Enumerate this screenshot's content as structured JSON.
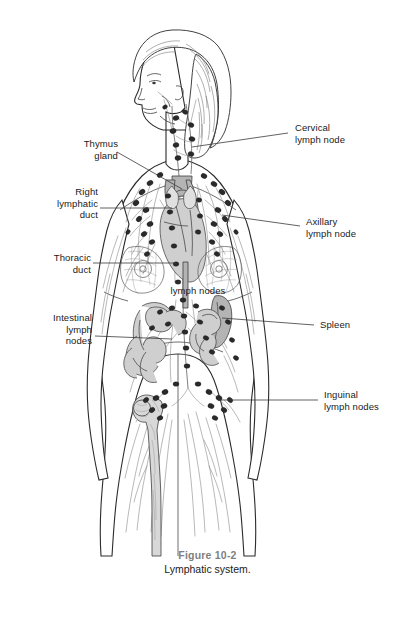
{
  "figure": {
    "number": "Figure 10-2",
    "title": "Lymphatic system."
  },
  "labels": {
    "thymus_gland": "Thymus\ngland",
    "right_lymphatic_duct": "Right\nlymphatic\nduct",
    "thoracic_duct": "Thoracic\nduct",
    "intestinal_lymph_nodes": "Intestinal\nlymph\nnodes",
    "lymph_nodes": "lymph nodes",
    "cervical_lymph_node": "Cervical\nlymph node",
    "axillary_lymph_node": "Axillary\nlymph node",
    "spleen": "Spleen",
    "inguinal_lymph_nodes": "Inguinal\nlymph nodes"
  },
  "colors": {
    "background": "#ffffff",
    "text": "#1a1a1a",
    "caption_number": "#7f7f7f",
    "leader_line": "#3a3a3a",
    "body_outline": "#2b2b2b",
    "vessel": "#8d8d8d",
    "lymph_node": "#2a2a2a",
    "organ_fill": "#cfcfcf",
    "bone_fill": "#d8d8d8"
  }
}
